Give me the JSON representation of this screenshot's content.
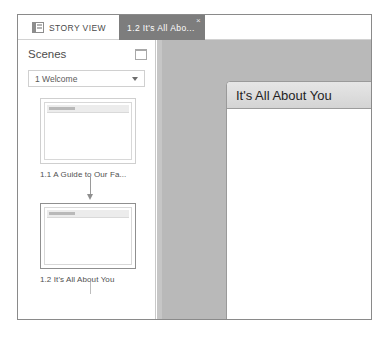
{
  "window": {
    "tabs": [
      {
        "id": "story-view",
        "label": "STORY VIEW",
        "icon": "story-view-icon",
        "active": false
      },
      {
        "id": "scene-slide",
        "label": "1.2 It's All Abo...",
        "icon": "",
        "active": true,
        "close_label": "×"
      }
    ]
  },
  "sidebar": {
    "title": "Scenes",
    "panel_icon": "panel-toggle-icon",
    "scene_selector": {
      "value": "1 Welcome",
      "placeholder": "Select a scene"
    },
    "slides": [
      {
        "label": "1.1 A Guide to Our Fa...",
        "selected": false
      },
      {
        "label": "1.2 It's All About You",
        "selected": true
      }
    ]
  },
  "canvas": {
    "slide": {
      "title": "It's All About You",
      "body": ""
    }
  },
  "colors": {
    "active_tab_bg": "#7d7d7d",
    "canvas_bg": "#b9b9b9",
    "slide_header_bg": "#e0e0e0",
    "sidebar_border": "#c9c9c9"
  }
}
